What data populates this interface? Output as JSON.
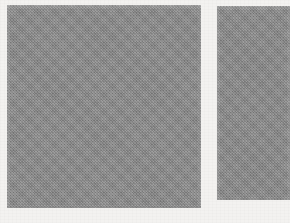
{
  "page": {
    "width": 290,
    "height": 223,
    "background_color": "#f3f2f0",
    "kind": "scanned-figure",
    "caption": "",
    "title": ""
  },
  "figure": {
    "panel_count": 2,
    "panels": [
      {
        "id": "panel-left",
        "label": "",
        "fill_color": "#8b8b8b",
        "texture": "dithered-grain",
        "x": 7,
        "y": 5,
        "width": 194,
        "height": 203
      },
      {
        "id": "panel-right",
        "label": "",
        "fill_color": "#8a8a8a",
        "texture": "dithered-grain",
        "x": 217,
        "y": 6,
        "width": 73,
        "height": 194
      }
    ]
  }
}
